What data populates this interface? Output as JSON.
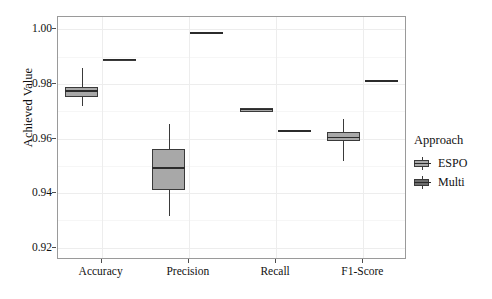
{
  "chart_data": {
    "type": "box",
    "title": "",
    "xlabel": "",
    "ylabel": "Achieved Value",
    "categories": [
      "Accuracy",
      "Precision",
      "Recall",
      "F1-Score"
    ],
    "ylim": [
      0.9155,
      1.0045
    ],
    "yticks": [
      0.92,
      0.94,
      0.96,
      0.98,
      1.0
    ],
    "ytick_labels": [
      "0.92",
      "0.94",
      "0.96",
      "0.98",
      "1.00"
    ],
    "grid": true,
    "legend": {
      "title": "Approach",
      "position": "right",
      "entries": [
        {
          "name": "ESPO",
          "fill": "#a8a8a8"
        },
        {
          "name": "Multi",
          "fill": "#6d6d6d"
        }
      ]
    },
    "series": [
      {
        "name": "ESPO",
        "fill": "#a8a8a8",
        "boxes": [
          {
            "category": "Accuracy",
            "min": 0.9714,
            "q1": 0.975,
            "median": 0.9771,
            "q3": 0.9786,
            "max": 0.9854
          },
          {
            "category": "Precision",
            "min": 0.9314,
            "q1": 0.9407,
            "median": 0.9489,
            "q3": 0.9557,
            "max": 0.965
          },
          {
            "category": "Recall",
            "min": 0.9693,
            "q1": 0.9693,
            "median": 0.9703,
            "q3": 0.9707,
            "max": 0.9707
          },
          {
            "category": "F1-Score",
            "min": 0.9514,
            "q1": 0.9586,
            "median": 0.96,
            "q3": 0.9621,
            "max": 0.9668
          }
        ]
      },
      {
        "name": "Multi",
        "fill": "#6d6d6d",
        "boxes": [
          {
            "category": "Accuracy",
            "min": 0.9886,
            "q1": 0.9886,
            "median": 0.9886,
            "q3": 0.9889,
            "max": 0.9889
          },
          {
            "category": "Precision",
            "min": 0.9982,
            "q1": 0.9982,
            "median": 0.9984,
            "q3": 0.9986,
            "max": 0.9986
          },
          {
            "category": "Recall",
            "min": 0.9621,
            "q1": 0.9621,
            "median": 0.9625,
            "q3": 0.9629,
            "max": 0.9629
          },
          {
            "category": "F1-Score",
            "min": 0.9804,
            "q1": 0.9804,
            "median": 0.9807,
            "q3": 0.9811,
            "max": 0.9811
          }
        ]
      }
    ]
  },
  "axis": {
    "y_title": "Achieved Value"
  },
  "legend": {
    "title": "Approach",
    "items": [
      {
        "label": "ESPO"
      },
      {
        "label": "Multi"
      }
    ]
  },
  "colors": {
    "espo_fill": "#a8a8a8",
    "multi_fill": "#6d6d6d",
    "outline": "#3a3a3a",
    "panel_border": "#9a9a9a",
    "grid_major": "#ededed"
  }
}
